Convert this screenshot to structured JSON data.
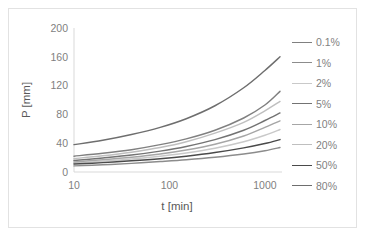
{
  "chart_data": {
    "type": "line",
    "title": "",
    "xlabel": "t [min]",
    "ylabel": "P [mm]",
    "xscale": "log",
    "yscale": "linear",
    "xlim": [
      10,
      1440
    ],
    "ylim": [
      0,
      200
    ],
    "xticks": [
      "10",
      "100",
      "1000"
    ],
    "xtick_values": [
      10,
      100,
      1000
    ],
    "yticks": [
      "0",
      "40",
      "80",
      "120",
      "160",
      "200"
    ],
    "ytick_values": [
      0,
      40,
      80,
      120,
      160,
      200
    ],
    "grid": false,
    "legend_position": "right",
    "x": [
      10,
      20,
      40,
      80,
      150,
      300,
      600,
      1000,
      1440
    ],
    "series": [
      {
        "name": "0.1%",
        "color": "#808080",
        "values": [
          22.0,
          26.0,
          31.0,
          38.0,
          46.0,
          58.0,
          75.0,
          93.0,
          112.0
        ]
      },
      {
        "name": "1%",
        "color": "#8c8c8c",
        "values": [
          8.5,
          10.0,
          12.0,
          14.5,
          17.0,
          20.5,
          25.0,
          29.5,
          34.0
        ]
      },
      {
        "name": "2%",
        "color": "#c9c9c9",
        "values": [
          12.5,
          15.0,
          18.0,
          22.0,
          26.5,
          33.0,
          42.0,
          51.0,
          59.0
        ]
      },
      {
        "name": "5%",
        "color": "#737373",
        "values": [
          16.0,
          19.5,
          23.5,
          29.0,
          35.5,
          45.0,
          58.0,
          71.5,
          82.0
        ]
      },
      {
        "name": "10%",
        "color": "#a6a6a6",
        "values": [
          14.0,
          17.0,
          20.5,
          25.0,
          30.5,
          38.5,
          50.0,
          62.0,
          71.0
        ]
      },
      {
        "name": "20%",
        "color": "#bfbfbf",
        "values": [
          18.5,
          22.5,
          27.5,
          34.0,
          42.0,
          54.0,
          69.0,
          85.0,
          98.0
        ]
      },
      {
        "name": "50%",
        "color": "#4a4a4a",
        "values": [
          11.0,
          13.0,
          15.5,
          18.5,
          22.0,
          27.0,
          33.5,
          39.5,
          45.0
        ]
      },
      {
        "name": "80%",
        "color": "#6e6e6e",
        "values": [
          38.0,
          44.0,
          52.0,
          62.0,
          74.0,
          92.0,
          117.0,
          141.0,
          160.0
        ]
      }
    ]
  },
  "legend": {
    "items": [
      {
        "label": "0.1%"
      },
      {
        "label": "1%"
      },
      {
        "label": "2%"
      },
      {
        "label": "5%"
      },
      {
        "label": "10%"
      },
      {
        "label": "20%"
      },
      {
        "label": "50%"
      },
      {
        "label": "80%"
      }
    ]
  },
  "colors": {
    "frame_border": "#e2e2e2",
    "axis": "#d9d9d9",
    "tick_text": "#7f7f7f",
    "axis_title_text": "#595959",
    "background": "#ffffff"
  }
}
